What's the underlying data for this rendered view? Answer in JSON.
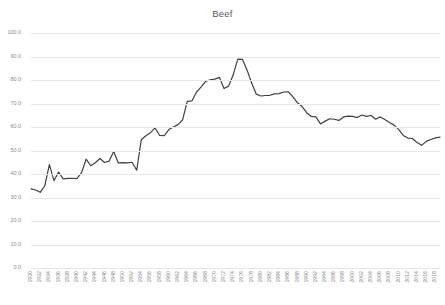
{
  "chart_data": {
    "type": "line",
    "title": "Beef",
    "xlabel": "",
    "ylabel": "",
    "ylim": [
      0.0,
      100.0
    ],
    "ytick_labels": [
      "100.0",
      "90.0",
      "80.0",
      "70.0",
      "60.0",
      "50.0",
      "40.0",
      "30.0",
      "20.0",
      "10.0",
      "0.0"
    ],
    "ytick_values": [
      100.0,
      90.0,
      80.0,
      70.0,
      60.0,
      50.0,
      40.0,
      30.0,
      20.0,
      10.0,
      0.0
    ],
    "grid": true,
    "legend": "none",
    "xtick_labels": [
      "1930",
      "1932",
      "1934",
      "1936",
      "1938",
      "1940",
      "1942",
      "1944",
      "1946",
      "1948",
      "1950",
      "1952",
      "1954",
      "1956",
      "1958",
      "1960",
      "1962",
      "1964",
      "1966",
      "1968",
      "1970",
      "1972",
      "1974",
      "1976",
      "1978",
      "1980",
      "1982",
      "1984",
      "1986",
      "1988",
      "1990",
      "1992",
      "1994",
      "1996",
      "1998",
      "2000",
      "2002",
      "2004",
      "2006",
      "2008",
      "2010",
      "2012",
      "2014",
      "2016",
      "2018"
    ],
    "x": [
      1930,
      1931,
      1932,
      1933,
      1934,
      1935,
      1936,
      1937,
      1938,
      1939,
      1940,
      1941,
      1942,
      1943,
      1944,
      1945,
      1946,
      1947,
      1948,
      1949,
      1950,
      1951,
      1952,
      1953,
      1954,
      1955,
      1956,
      1957,
      1958,
      1959,
      1960,
      1961,
      1962,
      1963,
      1964,
      1965,
      1966,
      1967,
      1968,
      1969,
      1970,
      1971,
      1972,
      1973,
      1974,
      1975,
      1976,
      1977,
      1978,
      1979,
      1980,
      1981,
      1982,
      1983,
      1984,
      1985,
      1986,
      1987,
      1988,
      1989,
      1990,
      1991,
      1992,
      1993,
      1994,
      1995,
      1996,
      1997,
      1998,
      1999,
      2000,
      2001,
      2002,
      2003,
      2004,
      2005,
      2006,
      2007,
      2008,
      2009,
      2010,
      2011,
      2012,
      2013,
      2014,
      2015,
      2016,
      2017,
      2018,
      2019
    ],
    "values": [
      33.7,
      33.2,
      32.2,
      35.0,
      44.0,
      37.2,
      40.8,
      37.9,
      38.1,
      38.2,
      38.0,
      40.6,
      46.3,
      43.5,
      44.8,
      46.6,
      44.9,
      45.5,
      49.6,
      44.7,
      44.8,
      44.7,
      45.0,
      41.6,
      54.6,
      56.3,
      57.6,
      59.6,
      56.4,
      56.3,
      58.9,
      60.0,
      61.0,
      63.1,
      70.9,
      71.1,
      74.8,
      77.0,
      79.4,
      80.1,
      80.4,
      81.1,
      76.4,
      77.4,
      82.2,
      88.9,
      88.8,
      84.3,
      78.8,
      74.0,
      73.2,
      73.4,
      73.5,
      74.1,
      74.2,
      74.9,
      75.0,
      72.8,
      70.3,
      68.7,
      66.1,
      64.5,
      64.3,
      61.3,
      62.5,
      63.5,
      63.3,
      62.8,
      64.3,
      64.6,
      64.5,
      64.0,
      65.1,
      64.5,
      64.9,
      63.3,
      64.3,
      63.2,
      61.9,
      60.8,
      59.0,
      56.4,
      55.3,
      55.1,
      53.4,
      52.2,
      53.9,
      54.7,
      55.4,
      55.7
    ],
    "line_color": "#404040",
    "line_width": 1.2
  }
}
